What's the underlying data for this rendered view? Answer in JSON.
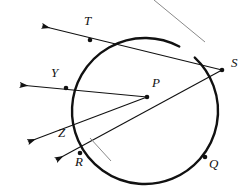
{
  "figure": {
    "kind": "geometry-diagram",
    "width": 252,
    "height": 191,
    "background_color": "#ffffff",
    "stroke_color": "#111111",
    "annotation_color": "#8a8a8a"
  },
  "circle": {
    "center": [
      145,
      111
    ],
    "radius": 73,
    "stroke_color": "#111111",
    "stroke_width": 2.4,
    "arc_gap_start_deg": -62,
    "arc_gap_end_deg": -47
  },
  "points": [
    {
      "id": "T",
      "label": "T",
      "x": 90,
      "y": 40,
      "label_x": 84,
      "label_y": 14,
      "dot": true
    },
    {
      "id": "S",
      "label": "S",
      "x": 222,
      "y": 70,
      "label_x": 231,
      "label_y": 56,
      "dot": true
    },
    {
      "id": "Y",
      "label": "Y",
      "x": 66,
      "y": 88,
      "label_x": 51,
      "label_y": 66,
      "dot": true
    },
    {
      "id": "P",
      "label": "P",
      "x": 147,
      "y": 97,
      "label_x": 152,
      "label_y": 76,
      "dot": true
    },
    {
      "id": "Z",
      "label": "Z",
      "x": 72,
      "y": 130,
      "label_x": 58,
      "label_y": 126,
      "dot": false
    },
    {
      "id": "R",
      "label": "R",
      "x": 80,
      "y": 153,
      "label_x": 75,
      "label_y": 155,
      "dot": true
    },
    {
      "id": "Q",
      "label": "Q",
      "x": 205,
      "y": 157,
      "label_x": 209,
      "label_y": 157,
      "dot": true
    }
  ],
  "rays": [
    {
      "id": "ray-S-T",
      "from": [
        222,
        70
      ],
      "through": [
        90,
        40
      ],
      "arrow_tip": [
        42,
        26
      ],
      "stroke_width": 1.1
    },
    {
      "id": "ray-P-Y",
      "from": [
        147,
        97
      ],
      "through": [
        66,
        88
      ],
      "arrow_tip": [
        20,
        85
      ],
      "stroke_width": 1.1
    },
    {
      "id": "ray-P-Z",
      "from": [
        147,
        97
      ],
      "through": [
        72,
        130
      ],
      "arrow_tip": [
        28,
        142
      ],
      "stroke_width": 1.1
    },
    {
      "id": "ray-S-R",
      "from": [
        222,
        70
      ],
      "through": [
        80,
        153
      ],
      "arrow_tip": [
        56,
        160
      ],
      "stroke_width": 1.1
    }
  ],
  "pointer_lines": [
    {
      "id": "pointer-to-arc-top",
      "from": [
        154,
        0
      ],
      "to": [
        205,
        42
      ],
      "stroke_color": "#8a8a8a",
      "stroke_width": 1.0
    },
    {
      "id": "pointer-to-arc-near-R",
      "from": [
        90,
        138
      ],
      "to": [
        111,
        161
      ],
      "stroke_color": "#8a8a8a",
      "stroke_width": 1.0
    }
  ]
}
